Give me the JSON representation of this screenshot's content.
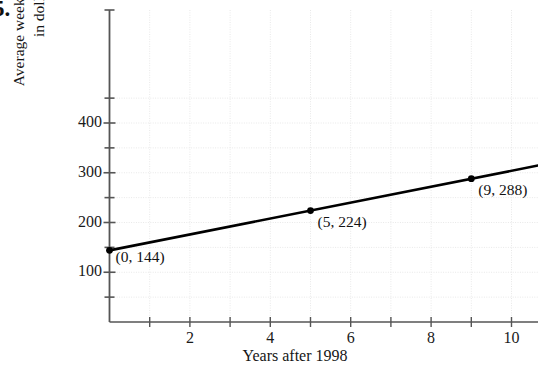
{
  "problem": {
    "number_label": "5."
  },
  "chart_data": {
    "type": "line",
    "title": "",
    "xlabel": "Years after 1998",
    "ylabel_line1": "Average weekly earnings",
    "ylabel_line2": "in dollars",
    "xlim": [
      -0.55,
      11.4
    ],
    "ylim": [
      0,
      470
    ],
    "grid": true,
    "legend": "none",
    "x_major_ticks": [
      2,
      4,
      6,
      8,
      10
    ],
    "x_major_tick_labels": [
      "2",
      "4",
      "6",
      "8",
      "10"
    ],
    "x_minor_ticks": [
      1,
      3,
      5,
      7,
      9,
      11
    ],
    "y_major_ticks": [
      100,
      200,
      300,
      400
    ],
    "y_major_tick_labels": [
      "100",
      "200",
      "300",
      "400"
    ],
    "y_minor_ticks": [
      50,
      150,
      250,
      350,
      450
    ],
    "x_gridlines": [
      1,
      2,
      3,
      4,
      5,
      6,
      7,
      8,
      9,
      10,
      11
    ],
    "y_gridlines": [
      50,
      100,
      150,
      200,
      250,
      300,
      350,
      400,
      450
    ],
    "series": [
      {
        "name": "Average weekly earnings",
        "x": [
          0,
          5,
          9
        ],
        "values": [
          144,
          224,
          288
        ],
        "line_extends_beyond_right_edge": true,
        "line_color": "#000000",
        "marker": "filled-circle"
      }
    ],
    "annotations": [
      {
        "text": "(0, 144)",
        "x": 0,
        "y": 144
      },
      {
        "text": "(5, 224)",
        "x": 5,
        "y": 224
      },
      {
        "text": "(9, 288)",
        "x": 9,
        "y": 288
      }
    ],
    "colors": {
      "background": "#ffffff",
      "line": "#000000",
      "marker": "#000000",
      "axis": "#555555",
      "grid": "#e8e8e8",
      "text": "#1a1a1a"
    }
  }
}
